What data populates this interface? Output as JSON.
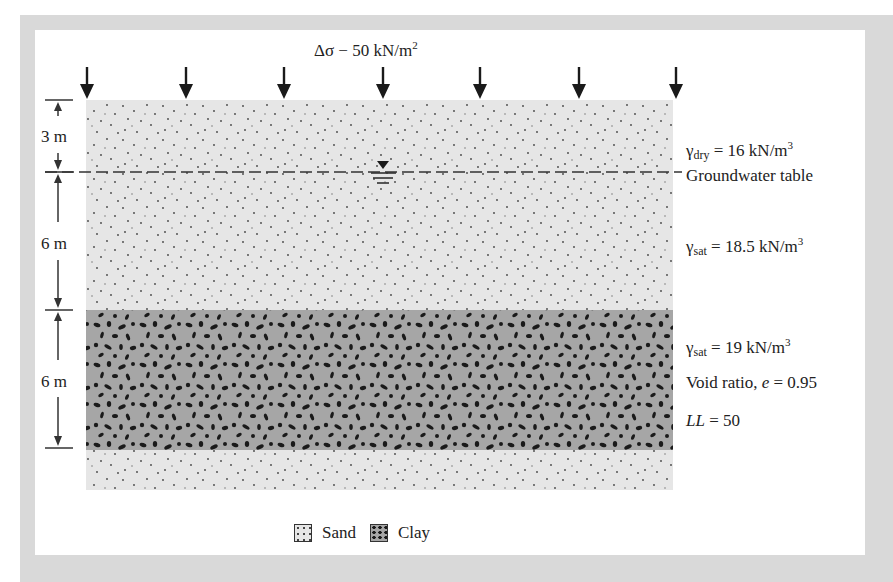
{
  "figure": {
    "load_label": "Δσ = 50 kN/m²",
    "load_label_parts": {
      "prefix": "Δσ − 50 kN/m",
      "sup": "2"
    },
    "load_arrow_count": 7,
    "dimensions": [
      {
        "label": "3 m"
      },
      {
        "label": "6 m"
      },
      {
        "label": "6 m"
      }
    ],
    "groundwater_label": "Groundwater table",
    "layers": [
      {
        "name": "sand-dry",
        "gamma_sym": "γ",
        "gamma_sub": "dry",
        "gamma_rest": " = 16 kN/m",
        "gamma_sup": "3"
      },
      {
        "name": "sand-saturated",
        "gamma_sym": "γ",
        "gamma_sub": "sat",
        "gamma_rest": " = 18.5 kN/m",
        "gamma_sup": "3"
      },
      {
        "name": "clay",
        "gamma_sym": "γ",
        "gamma_sub": "sat",
        "gamma_rest": " = 19 kN/m",
        "gamma_sup": "3",
        "void_ratio_label": "Void ratio, ",
        "void_ratio_sym": "e",
        "void_ratio_value": " = 0.95",
        "ll_sym": "LL",
        "ll_value": " = 50"
      }
    ],
    "legend": [
      {
        "label": "Sand"
      },
      {
        "label": "Clay"
      }
    ],
    "colors": {
      "frame": "#d9d9d9",
      "sand": "#e6e6e6",
      "clay": "#a6a6a6",
      "ink": "#1a1a1a"
    }
  }
}
